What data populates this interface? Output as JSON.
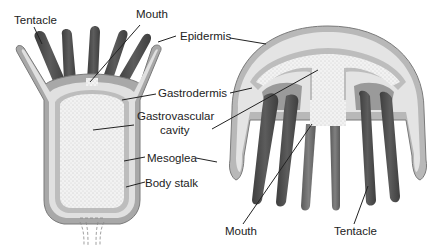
{
  "diagram": {
    "colors": {
      "epidermis": "#a8a8a8",
      "epidermis_outline": "#7a7a7a",
      "mesoglea": "#e2e2e2",
      "gastrodermis": "#bdbdbd",
      "cavity": "#f2f2f2",
      "cavity_dots": "#9a9a9a",
      "tentacle_dark": "#4a4a4a",
      "tentacle_mid": "#6e6e6e",
      "label_text": "#222222"
    },
    "polyp": {
      "labels": {
        "tentacle": "Tentacle",
        "mouth": "Mouth",
        "body_stalk": "Body stalk"
      }
    },
    "shared_labels": {
      "epidermis": "Epidermis",
      "gastrodermis": "Gastrodermis",
      "gastrovascular_line1": "Gastrovascular",
      "gastrovascular_line2": "cavity",
      "mesoglea": "Mesoglea"
    },
    "medusa": {
      "labels": {
        "mouth": "Mouth",
        "tentacle": "Tentacle"
      }
    }
  }
}
